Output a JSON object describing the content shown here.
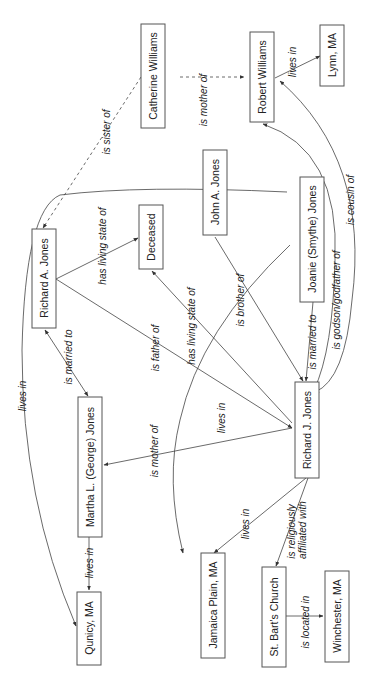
{
  "diagram": {
    "orientation": "rotated 90 degrees counter-clockwise",
    "nodes": {
      "catherine_williams": "Catherine Williams",
      "robert_williams": "Robert Williams",
      "lynn_ma": "Lynn, MA",
      "john_a_jones": "John A. Jones",
      "richard_a_jones": "Richard A. Jones",
      "deceased": "Deceased",
      "joanie_jones": "Joanie (Smythe) Jones",
      "martha_jones": "Martha L. (George) Jones",
      "richard_j_jones": "Richard J. Jones",
      "quincy_ma": "Qunicy, MA",
      "jamaica_plain_ma": "Jamaica Plain, MA",
      "st_barts_church": "St. Bart's Church",
      "winchester_ma": "Winchester, MA"
    },
    "edges": {
      "catherine_mother_of_robert": "is mother of",
      "catherine_sister_of_richard_a": "is sister of",
      "robert_lives_in_lynn": "lives in",
      "richard_j_cousin_of_robert": "is cousin of",
      "richard_j_godson_of_robert": "is godson/godfather of",
      "richard_a_has_state_deceased": "has living state of",
      "john_a_has_state_deceased": "has living state of",
      "richard_a_father_of_richard_j": "is father of",
      "richard_a_married_to_martha": "is married to",
      "john_a_lives_in_quincy": "lives in",
      "richard_j_brother_of_john_a": "is brother of",
      "joanie_married_to_richard_j": "is married to",
      "joanie_lives_in_jamaica_plain": "lives in",
      "martha_mother_of_richard_j": "is mother of",
      "martha_lives_in_quincy": "lives in",
      "richard_j_lives_in_jamaica_plain": "lives in",
      "richard_j_affiliated_with_church": "is religiously affiliated with",
      "church_located_in_winchester": "is located in"
    }
  }
}
